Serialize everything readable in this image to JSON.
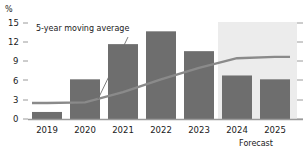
{
  "chart_data": {
    "type": "bar",
    "title": "",
    "subtitle": "",
    "xlabel": "",
    "ylabel": "%",
    "categories": [
      "2019",
      "2020",
      "2021",
      "2022",
      "2023",
      "2024",
      "2025"
    ],
    "values": [
      1.1,
      6.2,
      11.7,
      13.7,
      10.6,
      6.8,
      6.2
    ],
    "series": [
      {
        "name": "Annual value",
        "type": "bar",
        "values": [
          1.1,
          6.2,
          11.7,
          13.7,
          10.6,
          6.8,
          6.2
        ],
        "color": "#6e6e6e"
      },
      {
        "name": "5-year moving average",
        "type": "line",
        "values": [
          2.5,
          2.6,
          4.2,
          6.2,
          8.0,
          9.5,
          9.7
        ],
        "color": "#8a8a8a"
      }
    ],
    "ylim": [
      0,
      15
    ],
    "yticks": [
      0,
      3,
      6,
      9,
      12,
      15
    ],
    "ytick_labels": [
      "0",
      "3",
      "6",
      "9",
      "12",
      "15"
    ],
    "grid": false,
    "right_axis_ticks": true,
    "right_axis_tick_labels": [],
    "legend": null,
    "annotations": [
      {
        "text": "5-year moving average",
        "target_category": "2021",
        "kind": "leader-line"
      }
    ],
    "shaded_regions": [
      {
        "label": "Forecast",
        "from_category": "2024",
        "to_category": "2025",
        "color": "#ececec"
      }
    ]
  },
  "axis": {
    "y_unit": "%",
    "y_ticks": [
      "15",
      "12",
      "9",
      "6",
      "3",
      "0"
    ]
  },
  "x_labels": [
    "2019",
    "2020",
    "2021",
    "2022",
    "2023",
    "2024",
    "2025"
  ],
  "forecast": {
    "label": "Forecast"
  },
  "annotation": {
    "moving_average": "5-year moving average"
  },
  "colors": {
    "bar": "#6e6e6e",
    "line": "#8a8a8a",
    "forecast_band": "#ececec",
    "axis": "#9a9a9a",
    "text": "#1a1a1a"
  }
}
